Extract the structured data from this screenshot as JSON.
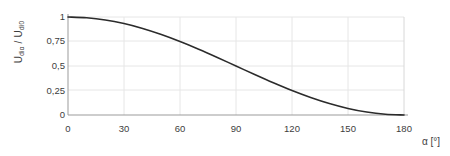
{
  "chart_data": {
    "type": "line",
    "title": "",
    "subtitle": "",
    "xlabel": "α [°]",
    "ylabel_plain": "U_diα / U_di0",
    "ylabel_main1": "U",
    "ylabel_sub1": "diα",
    "ylabel_sep": " / ",
    "ylabel_main2": "U",
    "ylabel_sub2": "di0",
    "xlim": [
      0,
      180
    ],
    "ylim": [
      0,
      1
    ],
    "xticks": [
      0,
      30,
      60,
      90,
      120,
      150,
      180
    ],
    "xtick_labels": [
      "0",
      "30",
      "60",
      "90",
      "120",
      "150",
      "180"
    ],
    "yticks": [
      0,
      0.25,
      0.5,
      0.75,
      1
    ],
    "ytick_labels": [
      "0",
      "0,25",
      "0,5",
      "0,75",
      "1"
    ],
    "grid": true,
    "grid_color": "#e3e3e3",
    "axis_color": "#a0a0a0",
    "legend": null,
    "legend_position": "none",
    "series": [
      {
        "name": "U_diα / U_di0 = (1 + cos α) / 2",
        "color": "#2b2b2b",
        "line_width": 1.6,
        "x": [
          0,
          10,
          20,
          30,
          40,
          50,
          60,
          70,
          80,
          90,
          100,
          110,
          120,
          130,
          140,
          150,
          160,
          170,
          180
        ],
        "y": [
          1.0,
          0.992,
          0.97,
          0.933,
          0.883,
          0.821,
          0.75,
          0.671,
          0.587,
          0.5,
          0.413,
          0.329,
          0.25,
          0.179,
          0.117,
          0.067,
          0.03,
          0.008,
          0.0
        ]
      }
    ],
    "annotations": []
  },
  "figure": {
    "background": "#ffffff",
    "width": 450,
    "height": 156
  }
}
